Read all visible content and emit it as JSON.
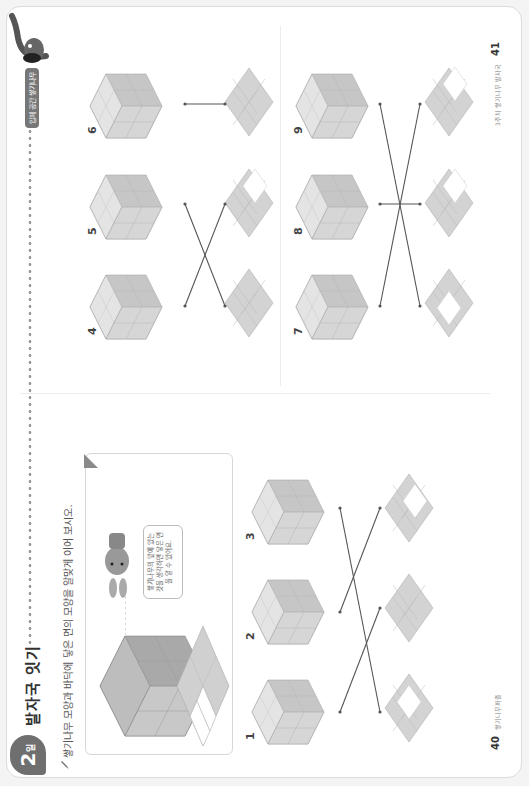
{
  "lesson": {
    "day_number": "2",
    "day_suffix": "일",
    "title": "발자국 잇기",
    "instruction": "쌓기나무 모양과 바닥에 닿은 면의 모양을 알맞게 이어 보시오.",
    "header_badge": "입체 공간 쌓기나무"
  },
  "example": {
    "hint_bubble": "쌓기나무의 앞에 있는 것을 생각하면 닿은 면을 알 수 있어요."
  },
  "problems": [
    {
      "number": "1"
    },
    {
      "number": "2"
    },
    {
      "number": "3"
    },
    {
      "number": "4"
    },
    {
      "number": "5"
    },
    {
      "number": "6"
    },
    {
      "number": "7"
    },
    {
      "number": "8"
    },
    {
      "number": "9"
    }
  ],
  "footer": {
    "left_page": "40",
    "left_text": "쌓기나무퍼즐",
    "right_page": "41",
    "right_text": "3주차 쌓기나무 발자국"
  },
  "colors": {
    "cube_top": "#e6e6e6",
    "cube_left": "#d2d2d2",
    "cube_right": "#bdbdbd",
    "footprint_fill": "#d0d0d0",
    "badge": "#6f6f6f",
    "line": "#555555"
  }
}
